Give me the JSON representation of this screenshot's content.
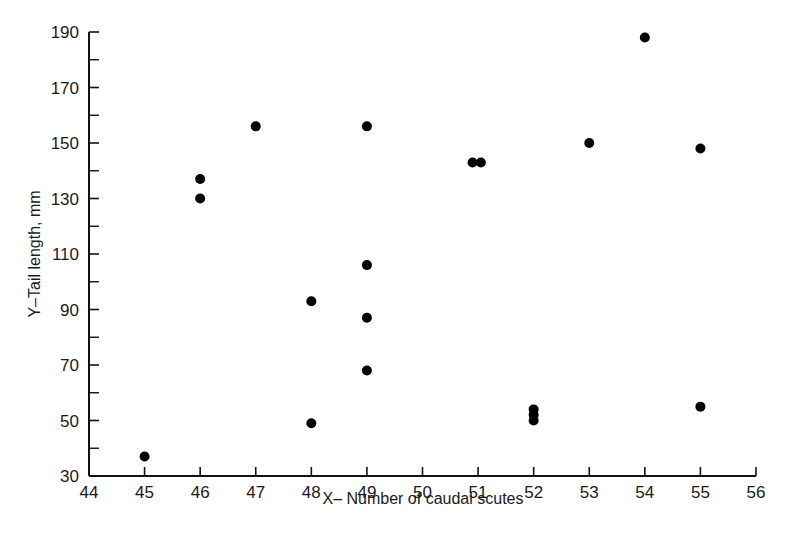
{
  "chart_data": {
    "type": "scatter",
    "title": "",
    "xlabel": "X– Number of caudal scutes",
    "ylabel": "Y–Tail length, mm",
    "xlim": [
      44,
      56
    ],
    "ylim": [
      30,
      190
    ],
    "x_ticks": [
      44,
      45,
      46,
      47,
      48,
      49,
      50,
      51,
      52,
      53,
      54,
      55,
      56
    ],
    "y_ticks": [
      30,
      50,
      70,
      90,
      110,
      130,
      150,
      170,
      190
    ],
    "y_minor_ticks": [
      40,
      60,
      80,
      100,
      120,
      140,
      160,
      180
    ],
    "grid": false,
    "legend": null,
    "marker_color": "#000000",
    "points": [
      {
        "x": 45,
        "y": 37
      },
      {
        "x": 46,
        "y": 137
      },
      {
        "x": 46,
        "y": 130
      },
      {
        "x": 47,
        "y": 156
      },
      {
        "x": 48,
        "y": 93
      },
      {
        "x": 48,
        "y": 49
      },
      {
        "x": 49,
        "y": 156
      },
      {
        "x": 49,
        "y": 106
      },
      {
        "x": 49,
        "y": 87
      },
      {
        "x": 49,
        "y": 68
      },
      {
        "x": 50.9,
        "y": 143
      },
      {
        "x": 51.05,
        "y": 143
      },
      {
        "x": 52,
        "y": 54
      },
      {
        "x": 52,
        "y": 52
      },
      {
        "x": 52,
        "y": 50
      },
      {
        "x": 53,
        "y": 150
      },
      {
        "x": 54,
        "y": 188
      },
      {
        "x": 55,
        "y": 148
      },
      {
        "x": 55,
        "y": 55
      }
    ]
  }
}
